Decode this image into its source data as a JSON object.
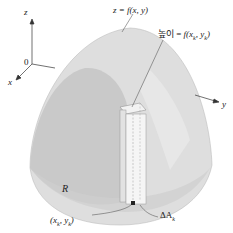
{
  "diagram": {
    "surface_label": "z = f(x, y)",
    "height_label": "높이 = f(xk, yk)",
    "height_label_prefix": "높이 = ",
    "height_label_func": "f(x",
    "height_label_k1": "k",
    "height_label_mid": ", y",
    "height_label_k2": "k",
    "height_label_end": ")",
    "region_label": "R",
    "point_label_open": "(x",
    "point_label_k1": "k",
    "point_label_mid": ", y",
    "point_label_k2": "k",
    "point_label_close": ")",
    "area_label_delta": "ΔA",
    "area_label_k": "k",
    "axes": {
      "z": "z",
      "x": "x",
      "y": "y",
      "origin": "0"
    },
    "colors": {
      "surface_outer": "#dcdcdc",
      "surface_inner": "#c8c8c8",
      "region_shadow": "#bdbdbd",
      "column": "#ececec",
      "line": "#444444"
    }
  }
}
